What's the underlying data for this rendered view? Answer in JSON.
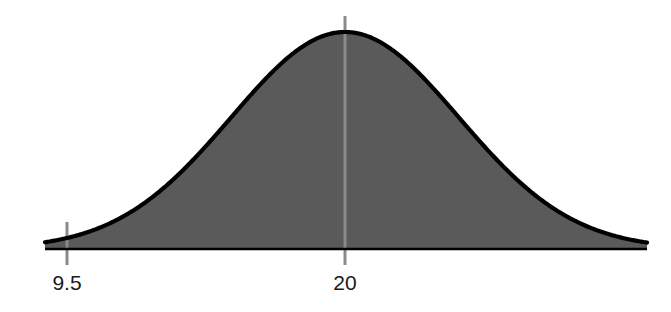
{
  "figure": {
    "kind": "normal-distribution-curve",
    "background_color": "#ffffff",
    "fill_color": "#5a5a5a",
    "curve_color": "#000000",
    "baseline_color": "#000000",
    "tick_color": "#8a8a8a",
    "label_color": "#1a1a1a"
  },
  "axis": {
    "ticks": [
      {
        "name": "lower-bound-tick",
        "label": "9.5",
        "value": 9.5,
        "x_px": 67,
        "label_x_px": 67,
        "label_y_px": 290,
        "extends_above_baseline": true,
        "extends_below_baseline": true
      },
      {
        "name": "mean-tick",
        "label": "20",
        "value": 20,
        "x_px": 345,
        "label_x_px": 345,
        "label_y_px": 290,
        "extends_above_baseline": true,
        "extends_below_baseline": true
      }
    ],
    "baseline_y_px": 249,
    "baseline_x_start_px": 45,
    "baseline_x_end_px": 647
  },
  "chart_data": {
    "type": "area",
    "title": "",
    "subtitle": "",
    "xlabel": "",
    "ylabel": "",
    "grid": false,
    "legend": null,
    "distribution": "normal",
    "mean": 20,
    "std_dev": 4.3,
    "tick_labels": [
      "9.5",
      "20"
    ],
    "tick_values": [
      9.5,
      20
    ],
    "xlim": [
      -2.8,
      42.8
    ],
    "ylim": [
      0,
      1
    ],
    "peak_x": 20,
    "peak_y": 1,
    "annotations": [
      {
        "text": "9.5",
        "at_x": 9.5,
        "kind": "axis-tick-label"
      },
      {
        "text": "20",
        "at_x": 20,
        "kind": "axis-tick-label"
      }
    ],
    "x": [
      -2.8,
      -0.5,
      1.8,
      4.1,
      6.4,
      8.7,
      9.5,
      11.0,
      13.3,
      15.6,
      17.9,
      20.0,
      22.1,
      24.4,
      26.7,
      29.0,
      31.3,
      33.6,
      35.9,
      38.2,
      40.5,
      42.8
    ],
    "values": [
      0.001,
      0.003,
      0.01,
      0.031,
      0.08,
      0.176,
      0.221,
      0.33,
      0.53,
      0.745,
      0.921,
      1.0,
      0.921,
      0.745,
      0.53,
      0.33,
      0.176,
      0.08,
      0.031,
      0.01,
      0.003,
      0.001
    ],
    "series": [
      {
        "name": "normal-pdf",
        "values": [
          0.001,
          0.003,
          0.01,
          0.031,
          0.08,
          0.176,
          0.221,
          0.33,
          0.53,
          0.745,
          0.921,
          1.0,
          0.921,
          0.745,
          0.53,
          0.33,
          0.176,
          0.08,
          0.031,
          0.01,
          0.003,
          0.001
        ]
      }
    ]
  }
}
